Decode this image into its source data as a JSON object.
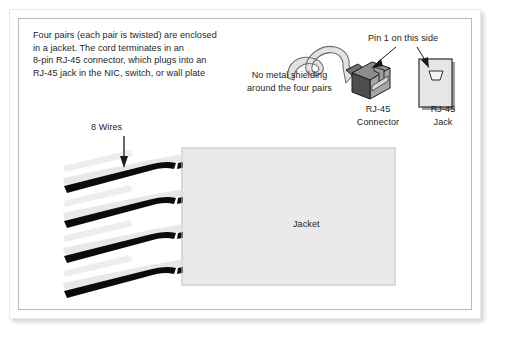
{
  "figure": {
    "type": "utp-cable-diagram",
    "background_color": "#ffffff",
    "frame_border_color": "#b9b9b9",
    "text_color": "#221f1f"
  },
  "annotations": {
    "intro_text": "Four pairs (each pair is twisted) are enclosed\nin a jacket. The cord terminates in an\n8-pin RJ-45 connector, which plugs into an\nRJ-45 jack in the NIC, switch, or wall plate",
    "shielding_note": "No metal shielding\naround the four pairs",
    "pin1_note": "Pin 1 on this side",
    "wires_label": "8 Wires",
    "connector_label": "RJ-45\nConnector",
    "jack_label": "RJ-45\nJack",
    "jacket_label": "Jacket"
  },
  "parts": {
    "jacket": {
      "label": "Jacket",
      "fill": "#eaeaea",
      "stroke": "#c9c9c9"
    },
    "rj45_connector": {
      "label": "RJ-45 Connector",
      "body_fill": "#7d7d7d",
      "face_fill": "#9a9a9a",
      "stroke": "#1a1a1a"
    },
    "rj45_jack": {
      "label": "RJ-45 Jack",
      "fill": "#e4e4e4",
      "stroke": "#4a4a4a",
      "port_fill": "#f2f2f2"
    },
    "cable": {
      "fill": "#e0e0e0",
      "stroke": "#6a6a6a"
    },
    "wire_pairs": {
      "count": 4,
      "wires_total": 8,
      "dark_wire_color": "#0a0a0a",
      "light_wire_color": "#e6e6e6"
    }
  }
}
